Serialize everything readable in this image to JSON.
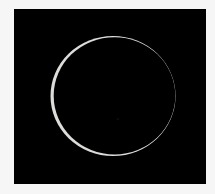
{
  "image": {
    "subject": "annular solar eclipse ring",
    "background_color": "#000000",
    "frame_color": "#f6f6f6",
    "ring_color": "#d8d8d4"
  }
}
